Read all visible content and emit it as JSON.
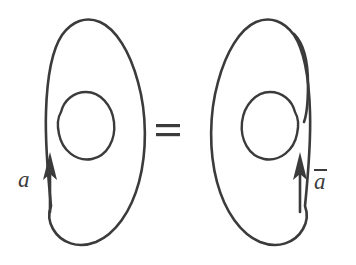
{
  "figure": {
    "kind": "knot-diagram",
    "title": "",
    "background_color": "#ffffff",
    "stroke_color": "#3b3b3b",
    "stroke_width": 2.6,
    "width": 356,
    "height": 265,
    "relation_symbol": "=",
    "panels": [
      {
        "id": "left",
        "name": "left-knot",
        "label": "a",
        "label_has_overbar": false,
        "orientation": "counterclockwise",
        "arrow_direction": "up",
        "arrow_x": 50,
        "arrow_tip_y": 155,
        "description": "outer loop with inner open spiral, arrow on left strand pointing up"
      },
      {
        "id": "right",
        "name": "right-knot",
        "label": "a",
        "label_has_overbar": true,
        "orientation": "clockwise",
        "arrow_direction": "up",
        "arrow_x": 300,
        "arrow_tip_y": 155,
        "description": "mirror image of left knot, arrow on right strand pointing up"
      }
    ],
    "labels": {
      "left_label": "a",
      "right_label": "a",
      "right_label_overbar": true,
      "equals": "="
    },
    "paths": {
      "left_outer": "M 50,210 C 50,150 44,96 48,66 C 52,36 66,20 84,20 C 106,20 128,48 138,84 C 148,120 144,168 130,196 C 116,226 94,244 74,242 C 56,240 44,228 48,214",
      "left_inner": "M 62,110 C 66,98 78,92 88,94 C 102,97 112,112 112,128 C 112,146 100,158 86,157 C 70,156 58,142 58,126 C 58,118 60,112 62,110",
      "right_outer": "M 306,210 C 306,150 312,96 308,66 C 304,36 290,20 272,20 C 250,20 228,48 218,84 C 208,120 212,168 226,196 C 240,226 262,244 282,242 C 300,240 312,228 308,214",
      "right_hook": "M 296,26 C 306,34 310,50 310,70 C 310,90 308,104 304,118",
      "right_inner": "M 294,150 C 290,160 278,164 268,162 C 254,159 244,144 244,128 C 244,110 256,98 270,99 C 286,100 298,114 298,130 C 298,138 296,146 294,150"
    },
    "equals_sign": {
      "x": 156,
      "y": 126,
      "width": 24,
      "bar_height": 3,
      "gap": 7
    }
  }
}
